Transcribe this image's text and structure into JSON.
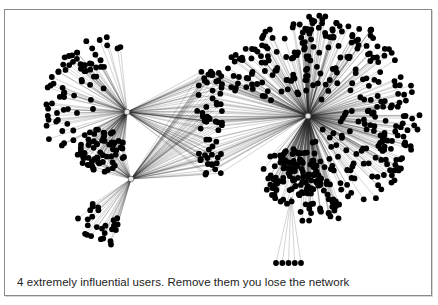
{
  "caption": "4 extremely influential users. Remove them you lose the network",
  "graph": {
    "description": "Social network graph with 4 hub users connecting multiple clusters",
    "colors": {
      "node_fill": "#c9c9c9",
      "node_stroke": "#6e6e6e",
      "edge": "#2a2a2a",
      "frame": "#8a8a8a"
    },
    "hubs": [
      {
        "id": "hub-1",
        "x": 126,
        "y": 111
      },
      {
        "id": "hub-2",
        "x": 130,
        "y": 178
      },
      {
        "id": "hub-3",
        "x": 307,
        "y": 115
      },
      {
        "id": "hub-4",
        "x": 209,
        "y": 120
      }
    ],
    "clusters": [
      {
        "name": "fan-top-left",
        "hub": 0,
        "type": "fan",
        "count": 70,
        "r_min": 30,
        "r_max": 85,
        "a_from": 150,
        "a_to": 265
      },
      {
        "name": "blob-left-middle",
        "hub": 0,
        "type": "blob",
        "cx": 100,
        "cy": 150,
        "rx": 24,
        "ry": 22,
        "count": 70,
        "also_hub": 1
      },
      {
        "name": "fan-bottom-left",
        "hub": 1,
        "type": "fan",
        "count": 26,
        "r_min": 35,
        "r_max": 75,
        "a_from": 105,
        "a_to": 150
      },
      {
        "name": "column-center",
        "type": "column",
        "cx": 209,
        "y_from": 70,
        "y_to": 176,
        "width": 26,
        "count": 60,
        "hubs": [
          0,
          1,
          2
        ]
      },
      {
        "name": "burst-right",
        "hub": 2,
        "type": "fan",
        "count": 260,
        "r_min": 18,
        "r_max": 112,
        "a_from": -95,
        "a_to": 95
      },
      {
        "name": "burst-right-top",
        "hub": 2,
        "type": "fan",
        "count": 90,
        "r_min": 20,
        "r_max": 100,
        "a_from": 200,
        "a_to": 275
      },
      {
        "name": "blob-right-bottom",
        "hub": 2,
        "type": "blob",
        "cx": 290,
        "cy": 175,
        "rx": 30,
        "ry": 28,
        "count": 110
      },
      {
        "name": "tail-bottom",
        "type": "row",
        "x_from": 275,
        "x_to": 300,
        "y": 262,
        "count": 5,
        "from": {
          "x": 290,
          "y": 196
        }
      }
    ]
  }
}
